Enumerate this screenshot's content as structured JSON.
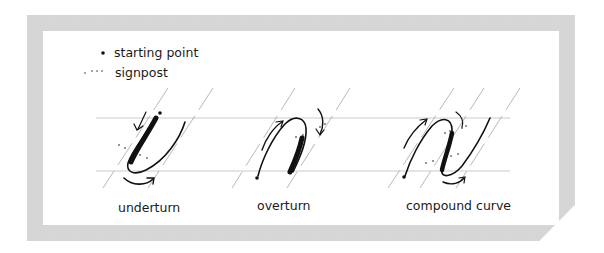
{
  "legend": {
    "items": [
      {
        "symbol": "dot",
        "label": "starting point"
      },
      {
        "symbol": "dotted",
        "label": "signpost"
      }
    ]
  },
  "figures": [
    {
      "id": "underturn",
      "label": "underturn"
    },
    {
      "id": "overturn",
      "label": "overturn"
    },
    {
      "id": "compound-curve",
      "label": "compound curve"
    }
  ],
  "colors": {
    "frame": "#d6d6d6",
    "ink": "#111111",
    "guide": "#b8b8b8"
  }
}
